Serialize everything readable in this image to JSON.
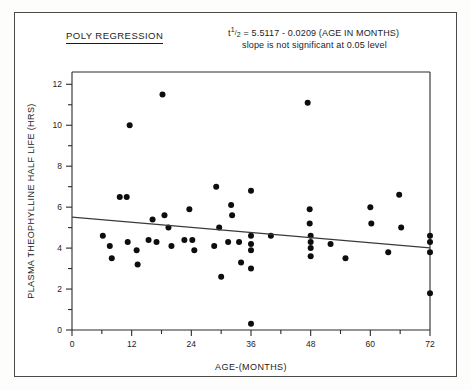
{
  "figure": {
    "title": "POLY REGRESSION",
    "equation_line1_prefix": "t",
    "equation_line1_num": "1",
    "equation_line1_den": "2",
    "equation_line1_rest": "= 5.5117 - 0.0209 (AGE IN MONTHS)",
    "equation_line2": "slope is not significant at 0.05 level",
    "border_color": "#4a4a4a",
    "point_color": "#0d0d0d",
    "line_color": "#3a3a3a"
  },
  "chart_data": {
    "type": "scatter",
    "title": "POLY REGRESSION",
    "xlabel": "AGE-(MONTHS)",
    "ylabel": "PLASMA THEOPHYLLINE HALF LIFE (HRS)",
    "xlim": [
      0,
      72
    ],
    "ylim": [
      0,
      12.6
    ],
    "grid": false,
    "legend": "none",
    "x_ticks_major": [
      0,
      12,
      24,
      36,
      48,
      60,
      72
    ],
    "x_ticks_minor": [
      6,
      18,
      30,
      42,
      54,
      66
    ],
    "y_ticks_major": [
      0,
      2,
      4,
      6,
      8,
      10,
      12
    ],
    "y_ticks_minor": [
      1,
      3,
      5,
      7,
      9,
      11
    ],
    "annotations": [
      "t1/2 = 5.5117 - 0.0209 (AGE IN MONTHS)",
      "slope is not significant at 0.05 level"
    ],
    "fit_line": {
      "name": "linear regression",
      "intercept": 5.5117,
      "slope": -0.0209,
      "x_start": 0,
      "x_end": 72,
      "y_start": 5.51,
      "y_end": 4.01,
      "significant": false,
      "alpha": 0.05
    },
    "points": [
      {
        "x": 6.2,
        "y": 4.6
      },
      {
        "x": 7.6,
        "y": 4.1
      },
      {
        "x": 8.0,
        "y": 3.5
      },
      {
        "x": 9.6,
        "y": 6.5
      },
      {
        "x": 11.0,
        "y": 6.5
      },
      {
        "x": 11.2,
        "y": 4.3
      },
      {
        "x": 11.6,
        "y": 10.0
      },
      {
        "x": 13.0,
        "y": 3.9
      },
      {
        "x": 13.2,
        "y": 3.2
      },
      {
        "x": 15.4,
        "y": 4.4
      },
      {
        "x": 16.2,
        "y": 5.4
      },
      {
        "x": 17.0,
        "y": 4.3
      },
      {
        "x": 18.2,
        "y": 11.5
      },
      {
        "x": 18.6,
        "y": 5.6
      },
      {
        "x": 19.4,
        "y": 5.0
      },
      {
        "x": 20.0,
        "y": 4.1
      },
      {
        "x": 22.6,
        "y": 4.4
      },
      {
        "x": 23.6,
        "y": 5.9
      },
      {
        "x": 24.2,
        "y": 4.4
      },
      {
        "x": 24.6,
        "y": 3.9
      },
      {
        "x": 28.6,
        "y": 4.1
      },
      {
        "x": 29.0,
        "y": 7.0
      },
      {
        "x": 29.6,
        "y": 5.0
      },
      {
        "x": 30.0,
        "y": 2.6
      },
      {
        "x": 31.4,
        "y": 4.3
      },
      {
        "x": 32.0,
        "y": 6.1
      },
      {
        "x": 32.2,
        "y": 5.6
      },
      {
        "x": 33.6,
        "y": 4.3
      },
      {
        "x": 34.0,
        "y": 3.3
      },
      {
        "x": 36.0,
        "y": 6.8
      },
      {
        "x": 36.0,
        "y": 4.6
      },
      {
        "x": 36.0,
        "y": 4.2
      },
      {
        "x": 36.0,
        "y": 3.9
      },
      {
        "x": 36.0,
        "y": 3.0
      },
      {
        "x": 36.0,
        "y": 0.3
      },
      {
        "x": 40.0,
        "y": 4.6
      },
      {
        "x": 47.4,
        "y": 11.1
      },
      {
        "x": 47.8,
        "y": 5.9
      },
      {
        "x": 47.8,
        "y": 5.2
      },
      {
        "x": 48.0,
        "y": 4.6
      },
      {
        "x": 48.0,
        "y": 4.3
      },
      {
        "x": 48.0,
        "y": 4.0
      },
      {
        "x": 48.0,
        "y": 3.6
      },
      {
        "x": 52.0,
        "y": 4.2
      },
      {
        "x": 55.0,
        "y": 3.5
      },
      {
        "x": 60.0,
        "y": 6.0
      },
      {
        "x": 60.2,
        "y": 5.2
      },
      {
        "x": 63.6,
        "y": 3.8
      },
      {
        "x": 65.8,
        "y": 6.6
      },
      {
        "x": 66.2,
        "y": 5.0
      },
      {
        "x": 72.0,
        "y": 4.6
      },
      {
        "x": 72.0,
        "y": 4.3
      },
      {
        "x": 72.0,
        "y": 3.8
      },
      {
        "x": 72.0,
        "y": 1.8
      }
    ]
  }
}
